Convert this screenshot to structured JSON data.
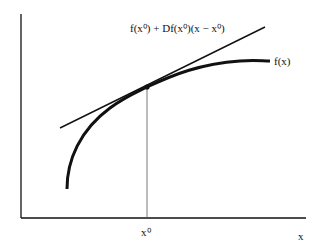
{
  "diagram": {
    "title": "",
    "tangent_label": "f(x⁰) + Df(x⁰)(x − x⁰)",
    "curve_label": "f(x)",
    "point_label": "x⁰",
    "x_axis_label": "x",
    "colors": {
      "line": "#111111",
      "background": "#ffffff",
      "guide": "#555555"
    }
  }
}
